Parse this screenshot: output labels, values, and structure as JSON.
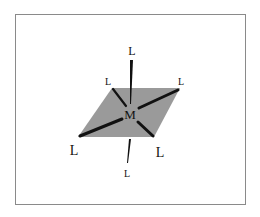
{
  "diagram": {
    "type": "octahedral coordination geometry",
    "center_atom": "M",
    "ligand_label": "L",
    "ligands": [
      {
        "position": "axial-top",
        "label": "L"
      },
      {
        "position": "equatorial-back-left",
        "label": "L"
      },
      {
        "position": "equatorial-back-right",
        "label": "L"
      },
      {
        "position": "equatorial-front-left",
        "label": "L"
      },
      {
        "position": "equatorial-front-right",
        "label": "L"
      },
      {
        "position": "axial-bottom",
        "label": "L"
      }
    ],
    "plane_color": "#9a9a9a",
    "bond_color": "#111111",
    "frame_color": "#8a8a8a"
  }
}
